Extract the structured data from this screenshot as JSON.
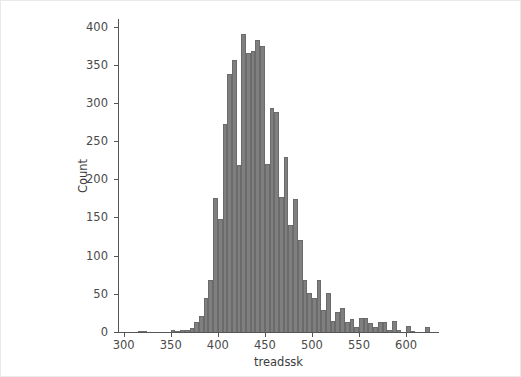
{
  "chart_data": {
    "type": "bar",
    "subtype": "histogram",
    "title": "",
    "xlabel": "treadssk",
    "ylabel": "Count",
    "xlim": [
      295,
      635
    ],
    "ylim": [
      0,
      410
    ],
    "xticks": [
      300,
      350,
      400,
      450,
      500,
      550,
      600
    ],
    "xticklabels": [
      "300",
      "350",
      "400",
      "450",
      "500",
      "550",
      "600"
    ],
    "yticks": [
      0,
      50,
      100,
      150,
      200,
      250,
      300,
      350,
      400
    ],
    "yticklabels": [
      "0",
      "50",
      "100",
      "150",
      "200",
      "250",
      "300",
      "350",
      "400"
    ],
    "grid": false,
    "legend": null,
    "bar_color": "#7f7f7f",
    "bar_edge_color": "#6b6b6b",
    "bin_width": 5,
    "bin_starts": [
      300,
      305,
      310,
      315,
      320,
      325,
      330,
      335,
      340,
      345,
      350,
      355,
      360,
      365,
      370,
      375,
      380,
      385,
      390,
      395,
      400,
      405,
      410,
      415,
      420,
      425,
      430,
      435,
      440,
      445,
      450,
      455,
      460,
      465,
      470,
      475,
      480,
      485,
      490,
      495,
      500,
      505,
      510,
      515,
      520,
      525,
      530,
      535,
      540,
      545,
      550,
      555,
      560,
      565,
      570,
      575,
      580,
      585,
      590,
      595,
      600,
      605,
      610,
      615,
      620,
      625,
      630
    ],
    "categories": [
      "300-305",
      "305-310",
      "310-315",
      "315-320",
      "320-325",
      "325-330",
      "330-335",
      "335-340",
      "340-345",
      "345-350",
      "350-355",
      "355-360",
      "360-365",
      "365-370",
      "370-375",
      "375-380",
      "380-385",
      "385-390",
      "390-395",
      "395-400",
      "400-405",
      "405-410",
      "410-415",
      "415-420",
      "420-425",
      "425-430",
      "430-435",
      "435-440",
      "440-445",
      "445-450",
      "450-455",
      "455-460",
      "460-465",
      "465-470",
      "470-475",
      "475-480",
      "480-485",
      "485-490",
      "490-495",
      "495-500",
      "500-505",
      "505-510",
      "510-515",
      "515-520",
      "520-525",
      "525-530",
      "530-535",
      "535-540",
      "540-545",
      "545-550",
      "550-555",
      "555-560",
      "560-565",
      "565-570",
      "570-575",
      "575-580",
      "580-585",
      "585-590",
      "590-595",
      "595-600",
      "600-605",
      "605-610",
      "610-615",
      "615-620",
      "620-625",
      "625-630",
      "630-635"
    ],
    "values": [
      0,
      0,
      0,
      1,
      1,
      0,
      0,
      0,
      0,
      0,
      2,
      1,
      3,
      2,
      5,
      13,
      21,
      44,
      68,
      175,
      148,
      272,
      338,
      356,
      219,
      391,
      366,
      368,
      383,
      374,
      220,
      293,
      288,
      177,
      229,
      140,
      174,
      120,
      68,
      51,
      44,
      68,
      29,
      51,
      15,
      26,
      32,
      13,
      17,
      7,
      18,
      18,
      12,
      6,
      13,
      13,
      2,
      15,
      2,
      0,
      8,
      1,
      0,
      0,
      6,
      0,
      0
    ],
    "n_bins": 67,
    "peak_bin": "425-430",
    "peak_value": 391
  },
  "figure": {
    "background_color": "#ffffff",
    "border_color": "#e9e9e9",
    "axis_color": "#555555",
    "text_color": "#4a4a4a"
  }
}
